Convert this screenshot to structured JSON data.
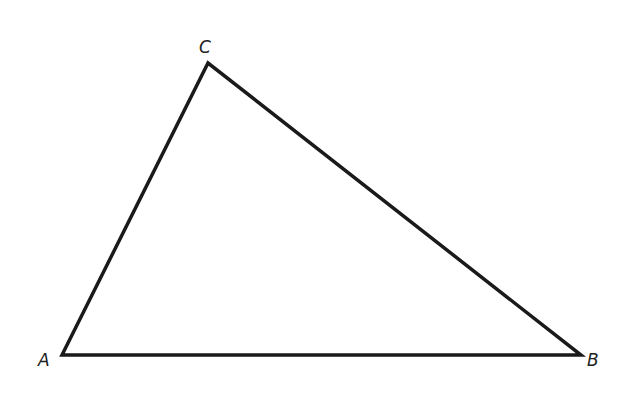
{
  "diagram": {
    "type": "triangle",
    "vertices": [
      {
        "id": "A",
        "label": "A"
      },
      {
        "id": "B",
        "label": "B"
      },
      {
        "id": "C",
        "label": "C"
      }
    ],
    "sides": [
      "AB",
      "BC",
      "CA"
    ],
    "stroke_color": "#1a1a1a"
  }
}
